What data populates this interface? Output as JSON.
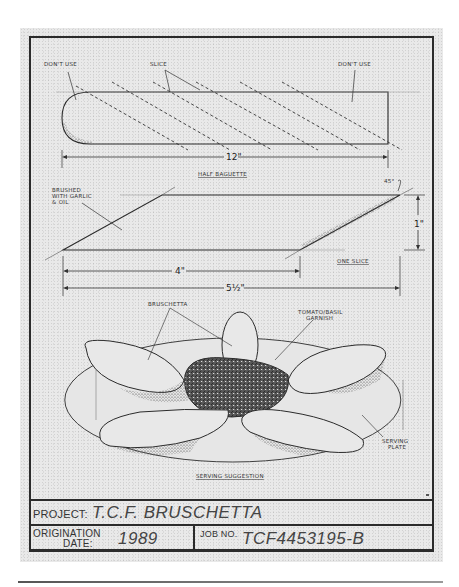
{
  "drawing": {
    "half_baguette": {
      "label_left": "DON'T USE",
      "label_slice": "SLICE",
      "label_right": "DON'T USE",
      "dimension_length": "12\"",
      "caption": "HALF BAGUETTE"
    },
    "one_slice": {
      "note": [
        "BRUSHED",
        "WITH GARLIC",
        "& OIL"
      ],
      "angle": "45°",
      "dimension_height": "1\"",
      "dimension_short": "4\"",
      "dimension_long": "5½\"",
      "caption": "ONE SLICE"
    },
    "serving": {
      "label_bruschetta": "BRUSCHETTA",
      "label_garnish": [
        "TOMATO/BASIL",
        "GARNISH"
      ],
      "label_plate": [
        "SERVING",
        "PLATE"
      ],
      "caption": "SERVING SUGGESTION"
    }
  },
  "title_block": {
    "project_label": "PROJECT:",
    "project_value": "T.C.F. BRUSCHETTA",
    "origination_label_1": "ORIGINATION",
    "origination_label_2": "DATE:",
    "origination_value": "1989",
    "job_label": "JOB NO.",
    "job_value": "TCF4453195-B"
  },
  "colors": {
    "paper": "#e9e9e9",
    "ink": "#2b2b2b"
  }
}
